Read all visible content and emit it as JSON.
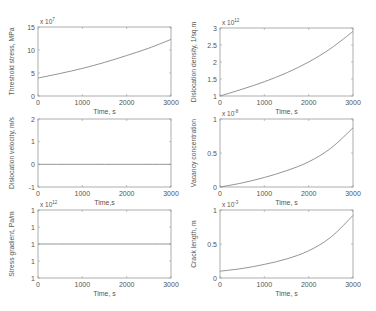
{
  "figure": {
    "colors": {
      "axis": "#9a9a9a",
      "line": "#888888",
      "text": "#555555",
      "background": "#ffffff"
    }
  },
  "chart_data": [
    {
      "id": "threshold-stress",
      "type": "line",
      "title": "",
      "xlabel": "Time, s",
      "ylabel": "Threshold stress, MPa",
      "exponent_label": "x 10",
      "exponent": "7",
      "xlim": [
        0,
        3000
      ],
      "ylim": [
        0,
        15
      ],
      "xticks": [
        "0",
        "1000",
        "2000",
        "3000"
      ],
      "yticks": [
        "0",
        "5",
        "10",
        "15"
      ],
      "ytick_values": [
        0,
        5,
        10,
        15
      ],
      "x": [
        0,
        500,
        1000,
        1500,
        2000,
        2500,
        3000
      ],
      "y": [
        3.9,
        4.9,
        6.0,
        7.3,
        8.8,
        10.4,
        12.3
      ]
    },
    {
      "id": "dislocation-density",
      "type": "line",
      "title": "",
      "xlabel": "Time, s",
      "ylabel": "Dislocation density, 1/sq.m",
      "exponent_label": "x 10",
      "exponent": "12",
      "xlim": [
        0,
        3000
      ],
      "ylim": [
        1,
        3
      ],
      "xticks": [
        "0",
        "1000",
        "2000",
        "3000"
      ],
      "yticks": [
        "1",
        "1.5",
        "2",
        "2.5",
        "3"
      ],
      "ytick_values": [
        1,
        1.5,
        2,
        2.5,
        3
      ],
      "x": [
        0,
        500,
        1000,
        1500,
        2000,
        2500,
        3000
      ],
      "y": [
        1.0,
        1.2,
        1.42,
        1.68,
        2.0,
        2.4,
        2.9
      ]
    },
    {
      "id": "dislocation-velocity",
      "type": "line",
      "title": "",
      "xlabel": "Time,s",
      "ylabel": "Dislocation velocity, m/s",
      "exponent_label": "",
      "exponent": "",
      "xlim": [
        0,
        3000
      ],
      "ylim": [
        -1,
        2
      ],
      "xticks": [
        "0",
        "1000",
        "2000",
        "3000"
      ],
      "yticks": [
        "-1",
        "0",
        "1",
        "2"
      ],
      "ytick_values": [
        -1,
        0,
        1,
        2
      ],
      "x": [
        0,
        3000
      ],
      "y": [
        0,
        0
      ]
    },
    {
      "id": "vacancy-concentration",
      "type": "line",
      "title": "",
      "xlabel": "Time, s",
      "ylabel": "Vacancy concentration",
      "exponent_label": "x 10",
      "exponent": "-8",
      "xlim": [
        0,
        3000
      ],
      "ylim": [
        0,
        1
      ],
      "xticks": [
        "0",
        "1000",
        "2000",
        "3000"
      ],
      "yticks": [
        "0",
        "0.5",
        "1"
      ],
      "ytick_values": [
        0,
        0.5,
        1
      ],
      "x": [
        0,
        500,
        1000,
        1500,
        2000,
        2500,
        3000
      ],
      "y": [
        0.0,
        0.06,
        0.14,
        0.24,
        0.37,
        0.57,
        0.87
      ]
    },
    {
      "id": "stress-gradient",
      "type": "line",
      "title": "",
      "xlabel": "Time, s",
      "ylabel": "Stress gradient, Pa/m",
      "exponent_label": "x 10",
      "exponent": "12",
      "xlim": [
        0,
        3000
      ],
      "ylim": [
        0,
        4
      ],
      "xticks": [
        "0",
        "1000",
        "2000",
        "3000"
      ],
      "yticks": [
        "1",
        "1",
        "1",
        "1",
        "1"
      ],
      "ytick_values": [
        0,
        1,
        2,
        3,
        4
      ],
      "x": [
        0,
        3000
      ],
      "y": [
        2,
        2
      ]
    },
    {
      "id": "crack-length",
      "type": "line",
      "title": "",
      "xlabel": "Time, s",
      "ylabel": "Crack length, m",
      "exponent_label": "x 10",
      "exponent": "-3",
      "xlim": [
        0,
        3000
      ],
      "ylim": [
        0,
        1
      ],
      "xticks": [
        "0",
        "1000",
        "2000",
        "3000"
      ],
      "yticks": [
        "0",
        "0.5",
        "1"
      ],
      "ytick_values": [
        0,
        0.5,
        1
      ],
      "x": [
        0,
        500,
        1000,
        1500,
        2000,
        2500,
        3000
      ],
      "y": [
        0.1,
        0.14,
        0.2,
        0.28,
        0.4,
        0.6,
        0.92
      ]
    }
  ]
}
